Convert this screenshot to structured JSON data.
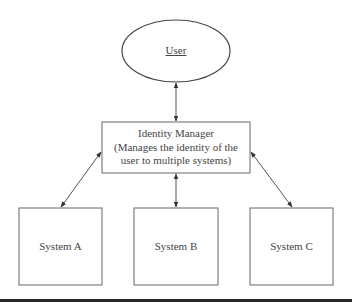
{
  "diagram": {
    "user": {
      "label": "User"
    },
    "identity_manager": {
      "title": "Identity Manager",
      "description_line1": "(Manages the identity of the",
      "description_line2": "user to multiple systems)"
    },
    "systems": [
      {
        "label": "System A"
      },
      {
        "label": "System B"
      },
      {
        "label": "System C"
      }
    ],
    "connections": [
      {
        "from": "User",
        "to": "Identity Manager",
        "type": "bidirectional"
      },
      {
        "from": "Identity Manager",
        "to": "System A",
        "type": "bidirectional"
      },
      {
        "from": "Identity Manager",
        "to": "System B",
        "type": "bidirectional"
      },
      {
        "from": "Identity Manager",
        "to": "System C",
        "type": "bidirectional"
      }
    ],
    "colors": {
      "stroke": "#555555",
      "text": "#444444",
      "rule": "#2a2a2a"
    }
  }
}
